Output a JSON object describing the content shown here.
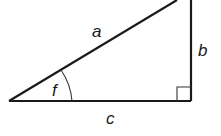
{
  "diagram": {
    "type": "right-triangle",
    "labels": {
      "hypotenuse": "a",
      "vertical_side": "b",
      "base": "c",
      "angle": "f"
    },
    "colors": {
      "stroke": "#1a1a1a",
      "background": "#ffffff"
    }
  }
}
